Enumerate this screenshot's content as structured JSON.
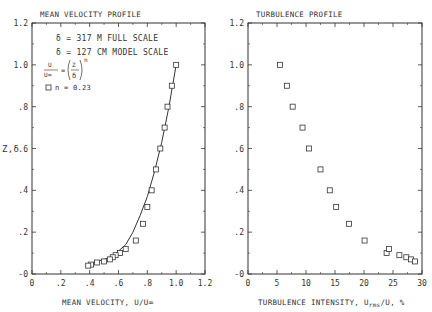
{
  "chart_data": [
    {
      "type": "scatter",
      "title": "MEAN VELOCITY PROFILE",
      "xlabel": "MEAN VELOCITY, U/U∞",
      "ylabel": "Z,δ",
      "xlim": [
        0,
        1.2
      ],
      "ylim": [
        0,
        1.2
      ],
      "xticks": [
        "0",
        ".2",
        ".4",
        ".6",
        ".8",
        "1.0",
        "1.2"
      ],
      "yticks": [
        "-0",
        ".2",
        ".4",
        ".6",
        ".8",
        "1.0",
        "1.2"
      ],
      "annotations": [
        "δ = 317 M FULL SCALE",
        "δ = 127 CM MODEL SCALE",
        "U/U∞ = (Z/δ)^n",
        "n = 0.23"
      ],
      "legend": [
        "□ n = 0.23"
      ],
      "series": [
        {
          "name": "measured",
          "x": [
            1.0,
            0.97,
            0.94,
            0.92,
            0.89,
            0.86,
            0.83,
            0.8,
            0.77,
            0.72,
            0.65,
            0.61,
            0.58,
            0.56,
            0.54,
            0.5,
            0.45,
            0.41,
            0.39
          ],
          "y": [
            1.0,
            0.9,
            0.8,
            0.7,
            0.6,
            0.5,
            0.4,
            0.32,
            0.24,
            0.16,
            0.12,
            0.1,
            0.09,
            0.08,
            0.07,
            0.06,
            0.055,
            0.045,
            0.04
          ]
        },
        {
          "name": "power law fit n=0.23",
          "x": [
            0.39,
            0.45,
            0.5,
            0.55,
            0.6,
            0.65,
            0.7,
            0.75,
            0.8,
            0.85,
            0.9,
            0.95,
            1.0
          ],
          "y": [
            0.04,
            0.06,
            0.07,
            0.08,
            0.11,
            0.14,
            0.2,
            0.28,
            0.37,
            0.49,
            0.63,
            0.8,
            1.0
          ]
        }
      ],
      "grid": false
    },
    {
      "type": "scatter",
      "title": "TURBULENCE PROFILE",
      "xlabel": "TURBULENCE INTENSITY, Urms/U, %",
      "ylabel": "",
      "xlim": [
        0,
        30
      ],
      "ylim": [
        0,
        1.2
      ],
      "xticks": [
        "0",
        "5",
        "10",
        "15",
        "20",
        "25",
        "30"
      ],
      "yticks": [
        "-0",
        ".2",
        ".4",
        ".6",
        ".8",
        "1.0",
        "1.2"
      ],
      "series": [
        {
          "name": "measured",
          "x": [
            5.5,
            6.7,
            7.7,
            9.4,
            10.5,
            12.5,
            14.1,
            15.2,
            17.4,
            20.1,
            23.9,
            24.3,
            26.1,
            27.3,
            28.1,
            28.8
          ],
          "y": [
            1.0,
            0.9,
            0.8,
            0.7,
            0.6,
            0.5,
            0.4,
            0.32,
            0.24,
            0.16,
            0.1,
            0.12,
            0.09,
            0.08,
            0.07,
            0.06
          ]
        }
      ],
      "grid": false
    }
  ],
  "left": {
    "title": "MEAN VELOCITY PROFILE",
    "xlabel": "MEAN VELOCITY, U/U∞",
    "ylabel": "Z,δ",
    "note1": "δ = 317 M FULL SCALE",
    "note2": "δ = 127 CM MODEL SCALE",
    "formula_lhs_num": "U",
    "formula_lhs_den": "U∞",
    "formula_eq": "=",
    "formula_rhs_num": "Z",
    "formula_rhs_den": "δ",
    "formula_exp": "n",
    "legend": "n = 0.23"
  },
  "right": {
    "title": "TURBULENCE PROFILE",
    "xlabel_pre": "TURBULENCE INTENSITY, U",
    "xlabel_sub": "rms",
    "xlabel_post": "/U, %"
  }
}
